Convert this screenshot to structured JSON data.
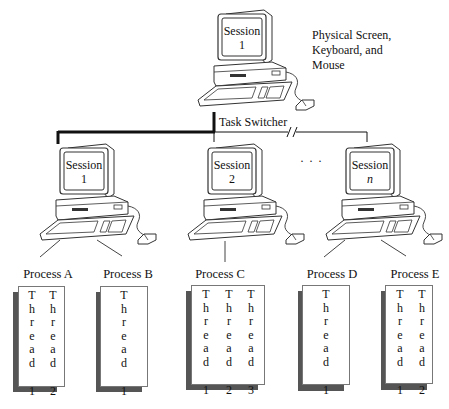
{
  "diagram": {
    "top_computer": {
      "screen_label": "Session",
      "screen_number": "1",
      "caption": [
        "Physical Screen,",
        "Keyboard, and",
        "Mouse"
      ]
    },
    "switch": {
      "label": "Task Switcher",
      "break_marker": "//"
    },
    "ellipsis": "· · ·",
    "sessions": [
      {
        "label": "Session",
        "number": "1",
        "italic": false
      },
      {
        "label": "Session",
        "number": "2",
        "italic": false
      },
      {
        "label": "Session",
        "number": "n",
        "italic": true
      }
    ],
    "processes": [
      {
        "name": "Process A",
        "session": "1",
        "threads": [
          "1",
          "2"
        ]
      },
      {
        "name": "Process B",
        "session": "1",
        "threads": [
          "1"
        ]
      },
      {
        "name": "Process C",
        "session": "2",
        "threads": [
          "1",
          "2",
          "3"
        ]
      },
      {
        "name": "Process D",
        "session": "n",
        "threads": [
          "1"
        ]
      },
      {
        "name": "Process E",
        "session": "n",
        "threads": [
          "1",
          "2"
        ]
      }
    ],
    "thread_word": [
      "T",
      "h",
      "r",
      "e",
      "a",
      "d"
    ],
    "colors": {
      "line": "#111111",
      "shadow": "#555555",
      "card_border": "#777777"
    }
  }
}
